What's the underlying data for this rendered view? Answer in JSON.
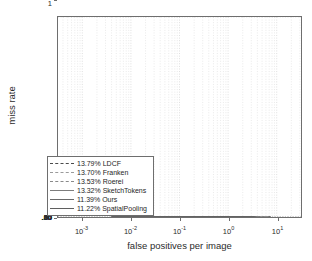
{
  "chart_data": {
    "type": "line",
    "title": "",
    "xlabel": "false positives per image",
    "ylabel": "miss rate",
    "xscale": "log",
    "yscale": "log-miss-rate",
    "xlim": [
      0.000316,
      31.6
    ],
    "ylim": [
      0.035,
      1.0
    ],
    "grid": true,
    "legend_position": "lower left",
    "xticks": [
      {
        "value": 0.001,
        "label": "10",
        "exp": "-3"
      },
      {
        "value": 0.01,
        "label": "10",
        "exp": "-2"
      },
      {
        "value": 0.1,
        "label": "10",
        "exp": "-1"
      },
      {
        "value": 1,
        "label": "10",
        "exp": "0"
      },
      {
        "value": 10,
        "label": "10",
        "exp": "1"
      }
    ],
    "yticks": [
      {
        "value": 1.0,
        "label": "1"
      },
      {
        "value": 0.8,
        "label": ".80"
      },
      {
        "value": 0.64,
        "label": ".64"
      },
      {
        "value": 0.5,
        "label": ".50"
      },
      {
        "value": 0.4,
        "label": ".40"
      },
      {
        "value": 0.3,
        "label": ".30"
      },
      {
        "value": 0.2,
        "label": ".20"
      },
      {
        "value": 0.1,
        "label": ".10"
      },
      {
        "value": 0.05,
        "label": ".05"
      }
    ],
    "series": [
      {
        "name": "LDCF",
        "score": "13.79%",
        "legend_label": "13.79% LDCF",
        "color": "#4a4a4a",
        "dash": "7,4",
        "width": 1.4,
        "points": [
          [
            0.004,
            0.95
          ],
          [
            0.004,
            0.6
          ],
          [
            0.006,
            0.6
          ],
          [
            0.006,
            0.43
          ],
          [
            0.0085,
            0.43
          ],
          [
            0.0085,
            0.41
          ],
          [
            0.011,
            0.41
          ],
          [
            0.011,
            0.355
          ],
          [
            0.015,
            0.355
          ],
          [
            0.015,
            0.34
          ],
          [
            0.02,
            0.34
          ],
          [
            0.02,
            0.33
          ],
          [
            0.028,
            0.33
          ],
          [
            0.028,
            0.305
          ],
          [
            0.038,
            0.305
          ],
          [
            0.038,
            0.285
          ],
          [
            0.052,
            0.285
          ],
          [
            0.052,
            0.26
          ],
          [
            0.07,
            0.26
          ],
          [
            0.07,
            0.23
          ],
          [
            0.095,
            0.23
          ],
          [
            0.095,
            0.2
          ],
          [
            0.13,
            0.2
          ],
          [
            0.13,
            0.175
          ],
          [
            0.18,
            0.175
          ],
          [
            0.18,
            0.15
          ],
          [
            0.25,
            0.15
          ],
          [
            0.25,
            0.132
          ],
          [
            0.34,
            0.132
          ],
          [
            0.34,
            0.115
          ],
          [
            0.47,
            0.115
          ],
          [
            0.47,
            0.1
          ],
          [
            0.65,
            0.1
          ],
          [
            0.65,
            0.088
          ],
          [
            0.9,
            0.088
          ],
          [
            0.9,
            0.077
          ],
          [
            1.3,
            0.077
          ],
          [
            1.3,
            0.068
          ],
          [
            1.9,
            0.068
          ],
          [
            1.9,
            0.06
          ],
          [
            2.8,
            0.06
          ],
          [
            2.8,
            0.055
          ],
          [
            4.2,
            0.055
          ],
          [
            4.2,
            0.052
          ],
          [
            6.3,
            0.052
          ],
          [
            6.3,
            0.05
          ],
          [
            7.5,
            0.05
          ]
        ]
      },
      {
        "name": "Franken",
        "score": "13.70%",
        "legend_label": "13.70% Franken",
        "color": "#9a9a9a",
        "dash": "6,3.5",
        "width": 1.4,
        "points": [
          [
            0.004,
            0.345
          ],
          [
            0.008,
            0.345
          ],
          [
            0.008,
            0.34
          ],
          [
            0.0115,
            0.34
          ],
          [
            0.0115,
            0.335
          ],
          [
            0.016,
            0.335
          ],
          [
            0.016,
            0.3
          ],
          [
            0.022,
            0.3
          ],
          [
            0.022,
            0.285
          ],
          [
            0.03,
            0.285
          ],
          [
            0.03,
            0.265
          ],
          [
            0.042,
            0.265
          ],
          [
            0.042,
            0.24
          ],
          [
            0.058,
            0.24
          ],
          [
            0.058,
            0.215
          ],
          [
            0.08,
            0.215
          ],
          [
            0.08,
            0.195
          ],
          [
            0.11,
            0.195
          ],
          [
            0.11,
            0.17
          ],
          [
            0.15,
            0.17
          ],
          [
            0.15,
            0.15
          ],
          [
            0.21,
            0.15
          ],
          [
            0.21,
            0.128
          ],
          [
            0.29,
            0.128
          ],
          [
            0.29,
            0.11
          ],
          [
            0.4,
            0.11
          ],
          [
            0.4,
            0.094
          ],
          [
            0.56,
            0.094
          ],
          [
            0.56,
            0.08
          ],
          [
            0.78,
            0.08
          ],
          [
            0.78,
            0.068
          ],
          [
            1.1,
            0.068
          ],
          [
            1.1,
            0.058
          ],
          [
            1.6,
            0.058
          ],
          [
            1.6,
            0.05
          ],
          [
            2.3,
            0.05
          ],
          [
            2.3,
            0.045
          ],
          [
            3.4,
            0.045
          ],
          [
            3.4,
            0.042
          ],
          [
            5.0,
            0.042
          ],
          [
            5.0,
            0.04
          ],
          [
            7.0,
            0.04
          ]
        ]
      },
      {
        "name": "Roerei",
        "score": "13.53%",
        "legend_label": "13.53% Roerei",
        "color": "#8a8a8a",
        "dash": "5,3",
        "width": 1.4,
        "points": [
          [
            0.004,
            0.345
          ],
          [
            0.0075,
            0.345
          ],
          [
            0.0075,
            0.342
          ],
          [
            0.0105,
            0.342
          ],
          [
            0.0105,
            0.36
          ],
          [
            0.0145,
            0.36
          ],
          [
            0.0145,
            0.33
          ],
          [
            0.02,
            0.33
          ],
          [
            0.02,
            0.312
          ],
          [
            0.0275,
            0.312
          ],
          [
            0.0275,
            0.292
          ],
          [
            0.038,
            0.292
          ],
          [
            0.038,
            0.268
          ],
          [
            0.052,
            0.268
          ],
          [
            0.052,
            0.245
          ],
          [
            0.072,
            0.245
          ],
          [
            0.072,
            0.218
          ],
          [
            0.1,
            0.218
          ],
          [
            0.1,
            0.192
          ],
          [
            0.14,
            0.192
          ],
          [
            0.14,
            0.165
          ],
          [
            0.195,
            0.165
          ],
          [
            0.195,
            0.142
          ],
          [
            0.27,
            0.142
          ],
          [
            0.27,
            0.12
          ],
          [
            0.37,
            0.12
          ],
          [
            0.37,
            0.102
          ],
          [
            0.52,
            0.102
          ],
          [
            0.52,
            0.086
          ],
          [
            0.72,
            0.086
          ],
          [
            0.72,
            0.072
          ],
          [
            1.0,
            0.072
          ],
          [
            1.0,
            0.06
          ],
          [
            1.45,
            0.06
          ],
          [
            1.45,
            0.051
          ],
          [
            2.1,
            0.051
          ],
          [
            2.1,
            0.046
          ],
          [
            3.1,
            0.046
          ],
          [
            3.1,
            0.042
          ],
          [
            4.6,
            0.042
          ],
          [
            4.6,
            0.039
          ],
          [
            6.8,
            0.039
          ]
        ]
      },
      {
        "name": "SketchTokens",
        "score": "13.32%",
        "legend_label": "13.32% SketchTokens",
        "color": "#7d7d7d",
        "dash": "",
        "width": 1.4,
        "points": [
          [
            0.004,
            0.345
          ],
          [
            0.009,
            0.345
          ],
          [
            0.009,
            0.33
          ],
          [
            0.0125,
            0.33
          ],
          [
            0.0125,
            0.318
          ],
          [
            0.0175,
            0.318
          ],
          [
            0.0175,
            0.3
          ],
          [
            0.024,
            0.3
          ],
          [
            0.024,
            0.282
          ],
          [
            0.033,
            0.282
          ],
          [
            0.033,
            0.262
          ],
          [
            0.045,
            0.262
          ],
          [
            0.045,
            0.24
          ],
          [
            0.062,
            0.24
          ],
          [
            0.062,
            0.218
          ],
          [
            0.086,
            0.218
          ],
          [
            0.086,
            0.196
          ],
          [
            0.12,
            0.196
          ],
          [
            0.12,
            0.172
          ],
          [
            0.165,
            0.172
          ],
          [
            0.165,
            0.15
          ],
          [
            0.23,
            0.15
          ],
          [
            0.23,
            0.128
          ],
          [
            0.32,
            0.128
          ],
          [
            0.32,
            0.108
          ],
          [
            0.44,
            0.108
          ],
          [
            0.44,
            0.09
          ],
          [
            0.61,
            0.09
          ],
          [
            0.61,
            0.075
          ],
          [
            0.85,
            0.075
          ],
          [
            0.85,
            0.062
          ],
          [
            1.2,
            0.062
          ],
          [
            1.2,
            0.052
          ],
          [
            1.7,
            0.052
          ],
          [
            1.7,
            0.045
          ],
          [
            2.5,
            0.045
          ],
          [
            2.5,
            0.041
          ],
          [
            3.7,
            0.041
          ],
          [
            3.7,
            0.038
          ],
          [
            5.5,
            0.038
          ]
        ]
      },
      {
        "name": "Ours",
        "score": "11.39%",
        "legend_label": "11.39% Ours",
        "color": "#6a6a6a",
        "dash": "",
        "width": 1.5,
        "points": [
          [
            0.004,
            0.33
          ],
          [
            0.0095,
            0.33
          ],
          [
            0.0095,
            0.25
          ],
          [
            0.013,
            0.25
          ],
          [
            0.013,
            0.242
          ],
          [
            0.018,
            0.242
          ],
          [
            0.018,
            0.232
          ],
          [
            0.025,
            0.232
          ],
          [
            0.025,
            0.218
          ],
          [
            0.034,
            0.218
          ],
          [
            0.034,
            0.205
          ],
          [
            0.047,
            0.205
          ],
          [
            0.047,
            0.192
          ],
          [
            0.065,
            0.192
          ],
          [
            0.065,
            0.176
          ],
          [
            0.09,
            0.176
          ],
          [
            0.09,
            0.158
          ],
          [
            0.125,
            0.158
          ],
          [
            0.125,
            0.14
          ],
          [
            0.175,
            0.14
          ],
          [
            0.175,
            0.122
          ],
          [
            0.24,
            0.122
          ],
          [
            0.24,
            0.104
          ],
          [
            0.33,
            0.104
          ],
          [
            0.33,
            0.088
          ],
          [
            0.46,
            0.088
          ],
          [
            0.46,
            0.073
          ],
          [
            0.64,
            0.073
          ],
          [
            0.64,
            0.06
          ],
          [
            0.88,
            0.06
          ],
          [
            0.88,
            0.049
          ],
          [
            1.25,
            0.049
          ],
          [
            1.25,
            0.042
          ],
          [
            1.8,
            0.042
          ],
          [
            1.8,
            0.038
          ],
          [
            2.6,
            0.038
          ],
          [
            2.6,
            0.036
          ],
          [
            3.8,
            0.036
          ]
        ]
      },
      {
        "name": "SpatialPooling",
        "score": "11.22%",
        "legend_label": "11.22% SpatialPooling",
        "color": "#5f5f5f",
        "dash": "",
        "width": 1.5,
        "points": [
          [
            0.004,
            0.332
          ],
          [
            0.0088,
            0.332
          ],
          [
            0.0088,
            0.322
          ],
          [
            0.012,
            0.322
          ],
          [
            0.012,
            0.312
          ],
          [
            0.0168,
            0.312
          ],
          [
            0.0168,
            0.296
          ],
          [
            0.023,
            0.296
          ],
          [
            0.023,
            0.278
          ],
          [
            0.032,
            0.278
          ],
          [
            0.032,
            0.258
          ],
          [
            0.044,
            0.258
          ],
          [
            0.044,
            0.236
          ],
          [
            0.06,
            0.236
          ],
          [
            0.06,
            0.212
          ],
          [
            0.083,
            0.212
          ],
          [
            0.083,
            0.19
          ],
          [
            0.115,
            0.19
          ],
          [
            0.115,
            0.166
          ],
          [
            0.16,
            0.166
          ],
          [
            0.16,
            0.144
          ],
          [
            0.22,
            0.144
          ],
          [
            0.22,
            0.122
          ],
          [
            0.305,
            0.122
          ],
          [
            0.305,
            0.102
          ],
          [
            0.42,
            0.102
          ],
          [
            0.42,
            0.084
          ],
          [
            0.58,
            0.084
          ],
          [
            0.58,
            0.068
          ],
          [
            0.81,
            0.068
          ],
          [
            0.81,
            0.055
          ],
          [
            1.15,
            0.055
          ],
          [
            1.15,
            0.047
          ],
          [
            1.65,
            0.047
          ],
          [
            1.65,
            0.041
          ],
          [
            2.4,
            0.041
          ],
          [
            2.4,
            0.037
          ],
          [
            3.5,
            0.037
          ]
        ]
      }
    ]
  },
  "axes": {
    "xlabel": "false positives per image",
    "ylabel": "miss rate"
  },
  "legend": {
    "entries": [
      "13.79% LDCF",
      "13.70% Franken",
      "13.53% Roerei",
      "13.32% SketchTokens",
      "11.39% Ours",
      "11.22% SpatialPooling"
    ]
  },
  "style": {
    "grid_color": "#c9c9c9",
    "frame_color": "#6e6e6e",
    "background": "#ffffff",
    "text_color": "#2b2b2b"
  }
}
